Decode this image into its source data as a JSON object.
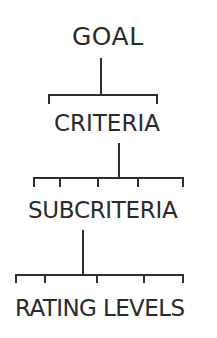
{
  "diagram": {
    "type": "hierarchy",
    "line_color": "#2e2e2e",
    "text_color": "#2a2a2a",
    "levels": [
      {
        "label": "GOAL",
        "children_count": 2
      },
      {
        "label": "CRITERIA",
        "children_count": 5
      },
      {
        "label": "SUBCRITERIA",
        "children_count": 5
      },
      {
        "label": "RATING LEVELS",
        "children_count": 0
      }
    ]
  }
}
